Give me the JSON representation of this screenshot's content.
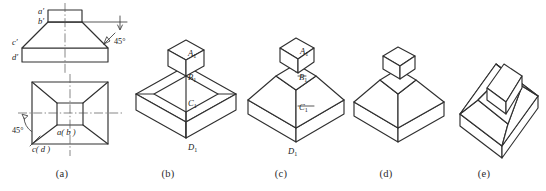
{
  "sheet": {
    "title": "Orthographic views and isometric solids of a truncated pyramid with boss",
    "ink_color": "#303030",
    "background": "#ffffff"
  },
  "figures": [
    {
      "key": "a",
      "caption": "(a)",
      "description": "Two-view orthographic drawing: front view above, top view below, joined by a vertical centerline",
      "views": {
        "front": {
          "name": "front-view",
          "labels": [
            "a'",
            "b'",
            "c'",
            "d'"
          ],
          "angle_annotation": "45°"
        },
        "top": {
          "name": "top-view",
          "labels": [
            "a(b)",
            "c(d)"
          ],
          "angle_annotation": "45°"
        }
      }
    },
    {
      "key": "b",
      "caption": "(b)",
      "description": "Isometric solid: flat slab base with bevelled top edges and a rectangular boss on top",
      "labels": [
        "A",
        "B",
        "C",
        "D"
      ],
      "label_subscript": "1"
    },
    {
      "key": "c",
      "caption": "(c)",
      "description": "Isometric solid: truncated pyramid on a thin base slab with a rectangular boss on top",
      "labels": [
        "A",
        "B",
        "C",
        "D"
      ],
      "label_subscript": "1"
    },
    {
      "key": "d",
      "caption": "(d)",
      "description": "Isometric solid, unlabelled, same form as (c)",
      "labels": []
    },
    {
      "key": "e",
      "caption": "(e)",
      "description": "Isometric solid rotated about 45 degrees, corner-on view of truncated pyramid with boss",
      "labels": []
    }
  ],
  "captions": {
    "a": "(a)",
    "b": "(b)",
    "c": "(c)",
    "d": "(d)",
    "e": "(e)"
  },
  "annotations": {
    "front_angle": "45°",
    "top_angle": "45°"
  },
  "point_labels": {
    "front": {
      "a_prime": "a′",
      "b_prime": "b′",
      "c_prime": "c′",
      "d_prime": "d′"
    },
    "top": {
      "ab": "a( b )",
      "cd": "c( d )"
    },
    "iso_b": {
      "A1_base": "A",
      "B1_base": "B",
      "C1_base": "C",
      "D1_base": "D",
      "sub": "1"
    },
    "iso_c": {
      "A1_base": "A",
      "B1_base": "B",
      "C1_base": "C",
      "D1_base": "D",
      "sub": "1"
    }
  }
}
